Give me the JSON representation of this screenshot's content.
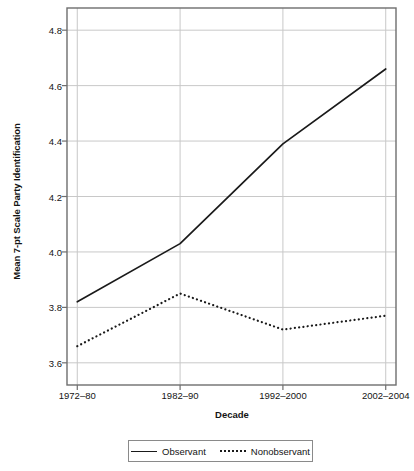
{
  "chart_data": {
    "type": "line",
    "title": "",
    "xlabel": "Decade",
    "ylabel": "Mean 7-pt Scale Party Identification",
    "categories": [
      "1972–80",
      "1982–90",
      "1992–2000",
      "2002–2004"
    ],
    "series": [
      {
        "name": "Observant",
        "style": "solid",
        "color": "#1a1a1a",
        "values": [
          3.82,
          4.03,
          4.39,
          4.66
        ]
      },
      {
        "name": "Nonobservant",
        "style": "dotted",
        "color": "#1a1a1a",
        "values": [
          3.66,
          3.85,
          3.72,
          3.77
        ]
      }
    ],
    "ylim": [
      3.52,
      4.88
    ],
    "yticks": [
      "3.6",
      "3.8",
      "4.0",
      "4.2",
      "4.4",
      "4.6",
      "4.8"
    ],
    "ytick_values": [
      3.6,
      3.8,
      4.0,
      4.2,
      4.4,
      4.6,
      4.8
    ],
    "grid": true,
    "grid_color": "#c8c8c8",
    "legend_position": "bottom",
    "axis_color": "#6e6e6e"
  }
}
